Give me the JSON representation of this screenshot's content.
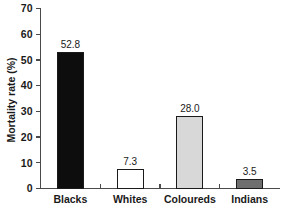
{
  "chart_data": {
    "type": "bar",
    "title": "",
    "subtitle": "",
    "xlabel": "",
    "ylabel": "Mortality rate (%)",
    "categories": [
      "Blacks",
      "Whites",
      "Coloureds",
      "Indians"
    ],
    "values": [
      52.8,
      7.3,
      28.0,
      3.5
    ],
    "value_labels": [
      "52.8",
      "7.3",
      "28.0",
      "3.5"
    ],
    "bar_colors": [
      "#0d0d0d",
      "#ffffff",
      "#d8d8d8",
      "#6e6e6e"
    ],
    "bar_edge_color": "#1a1a1a",
    "ylim": [
      0,
      70
    ],
    "ytick_values": [
      0,
      10,
      20,
      30,
      40,
      50,
      60,
      70
    ],
    "ytick_labels": [
      "0",
      "10",
      "20",
      "30",
      "40",
      "50",
      "60",
      "70"
    ],
    "grid": false,
    "legend": null,
    "legend_position": "none",
    "axis_color": "#4a4a4a"
  }
}
